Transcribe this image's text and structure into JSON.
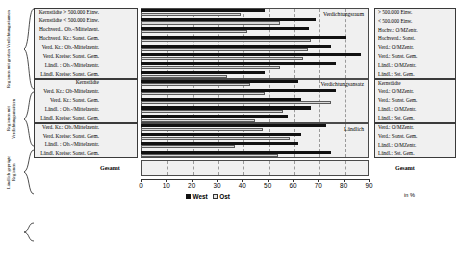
{
  "chart_data": {
    "type": "bar",
    "orientation": "horizontal",
    "title": "",
    "xlabel": "in %",
    "ylabel": "",
    "xlim": [
      0,
      90
    ],
    "xticks": [
      0,
      10,
      20,
      30,
      40,
      50,
      60,
      70,
      80,
      90
    ],
    "grid": true,
    "legend_position": "bottom",
    "legend": [
      "West",
      "Ost"
    ],
    "colors": {
      "West": "#111111",
      "Ost": "#d9d9d9"
    },
    "group_axis_labels": [
      "Regionen mit großen Verdichtungsräumen",
      "Regionen mit Verdichtungsansätzen",
      "Ländlich geprägte Regionen"
    ],
    "segments": [
      {
        "caption": "Verdichtungsraum",
        "categories": [
          "Kernstädte > 500.000 Einw.",
          "Kernstädte < 500.000 Einw.",
          "Hochverd.. Ob.-/Mittelzent.",
          "Hochverd. Kr.: Sonst. Gem.",
          "Verd. Kr.: Ob.-Mittelzentr.",
          "Verd. Kreise: Sonst. Gem.",
          "Ländl. : Ob.-/Mittelzentr.",
          "Ländl. Kreise: Sonst. Gem."
        ],
        "right_labels": [
          "> 500.000 Einw.",
          "< 500.000 Einw.",
          "Hochv.: O/MZentr.",
          "Hochverd.: Sonst.",
          "Verd.: O/MZentr.",
          "Verd.: Sonst. Gem.",
          "Ländl.: O/MZentr.",
          "Ländl.: Sst. Gem."
        ],
        "west": [
          49,
          69,
          66.5,
          81,
          75,
          87,
          77,
          49
        ],
        "ost": [
          39.5,
          55,
          42,
          67,
          66,
          64,
          55,
          34
        ]
      },
      {
        "caption": "Verdichtungsansatz",
        "categories": [
          "Kernstädte",
          "Verd. Kr.: Ob-Mittelzentr.",
          "Verd. Kr.: Sonst. Gem.",
          "Ländl. : Ob.-/Mittelzentr.",
          "Ländl. Kreise: Sonst. Gem."
        ],
        "right_labels": [
          "Kernstädte",
          "Verd.: O/MZentr.",
          "Verd.: Sonst. Gem.",
          "Ländl.: O/MZentr.",
          "Ländl.: Sst. Gem."
        ],
        "west": [
          62,
          77,
          63,
          67,
          58
        ],
        "ost": [
          43,
          49,
          75,
          56,
          45
        ]
      },
      {
        "caption": "Ländlich",
        "categories": [
          "Verd. Kr.: Ob./Mittelzentr.",
          "Verd. Kreise: Sonst. Gem.",
          "Ländl. : Ob.-/Mittelzentr.",
          "Ländl. Kreise: Sonst. Gem."
        ],
        "right_labels": [
          "Verd.: O/MZentr.",
          "Verd.: Sonst. Gem.",
          "Ländl.: O/MZentr.",
          "Ländl.: Sst. Gem."
        ],
        "west": [
          73,
          63,
          62,
          75
        ],
        "ost": [
          48,
          59,
          37,
          54
        ]
      }
    ],
    "total": {
      "label": "Gesamt",
      "right_label": "Gesamt",
      "west": 63,
      "ost": 51
    }
  }
}
